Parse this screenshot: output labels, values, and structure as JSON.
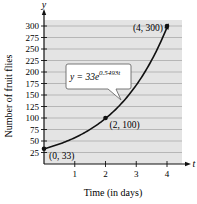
{
  "chart_data": {
    "type": "line",
    "title": "",
    "xlabel": "Time (in days)",
    "ylabel": "Number of fruit flies",
    "x_axis_symbol": "t",
    "y_axis_symbol": "y",
    "xlim": [
      0,
      4.5
    ],
    "ylim": [
      0,
      312
    ],
    "x_ticks": [
      1,
      2,
      3,
      4
    ],
    "y_ticks": [
      25,
      50,
      75,
      100,
      125,
      150,
      175,
      200,
      225,
      250,
      275,
      300
    ],
    "grid": "horizontal",
    "series": [
      {
        "name": "y = 33e^(0.5493t)",
        "function": "33*exp(0.5493*t)",
        "x": [
          0,
          0.5,
          1,
          1.5,
          2,
          2.5,
          3,
          3.5,
          4
        ],
        "values": [
          33,
          43.5,
          57.4,
          75.7,
          100,
          130.9,
          172.5,
          227.6,
          300
        ]
      }
    ],
    "annotations": [
      {
        "label": "(0, 33)",
        "x": 0,
        "y": 33
      },
      {
        "label": "(2, 100)",
        "x": 2,
        "y": 100
      },
      {
        "label": "(4, 300)",
        "x": 4,
        "y": 300
      }
    ],
    "equation_callout": {
      "base": "y = 33e",
      "exponent": "0.5493t"
    }
  },
  "colors": {
    "plot_background": "#e4e4e4",
    "gridline": "#a9a9a9",
    "curve": "#111111",
    "axis": "#111111"
  }
}
